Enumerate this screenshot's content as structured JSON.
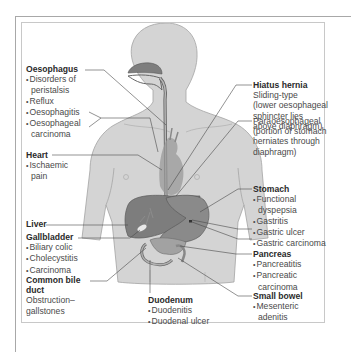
{
  "figure": {
    "colors": {
      "body": "#d3d3d3",
      "body_outline": "#9a9a9a",
      "organ_dark": "#7a7a7a",
      "organ_mid": "#939393",
      "leader_line": "#4a4a4a",
      "text": "#3a3a3a"
    },
    "labels": {
      "oesophagus": {
        "title": "Oesophagus",
        "items": [
          "Disorders of",
          "peristalsis",
          "Reflux",
          "Oesophagitis",
          "Oesophageal",
          "carcinoma"
        ]
      },
      "heart": {
        "title": "Heart",
        "items": [
          "Ischaemic",
          "pain"
        ]
      },
      "liver": {
        "title": "Liver"
      },
      "gallbladder": {
        "title": "Gallbladder",
        "items": [
          "Biliary colic",
          "Cholecystitis",
          "Carcinoma"
        ]
      },
      "common_bile_duct": {
        "title_line1": "Common bile",
        "title_line2": "duct",
        "text_line1": "Obstruction–",
        "text_line2": "gallstones"
      },
      "duodenum": {
        "title": "Duodenum",
        "items": [
          "Duodenitis",
          "Duodenal ulcer"
        ]
      },
      "hiatus_hernia": {
        "title": "Hiatus hernia",
        "sliding": [
          "Sliding-type",
          "(lower oesophageal",
          "sphincter lies",
          "above diaphragm)"
        ],
        "paraoesophageal": [
          "Paraoesophageal",
          "(portion of stomach",
          "herniates through",
          "diaphragm)"
        ]
      },
      "stomach": {
        "title": "Stomach",
        "items": [
          "Functional",
          "dyspepsia",
          "Gastritis",
          "Gastric ulcer",
          "Gastric carcinoma"
        ]
      },
      "pancreas": {
        "title": "Pancreas",
        "items": [
          "Pancreatitis",
          "Pancreatic",
          "carcinoma"
        ]
      },
      "small_bowel": {
        "title": "Small bowel",
        "items": [
          "Mesenteric",
          "adenitis"
        ]
      }
    }
  }
}
